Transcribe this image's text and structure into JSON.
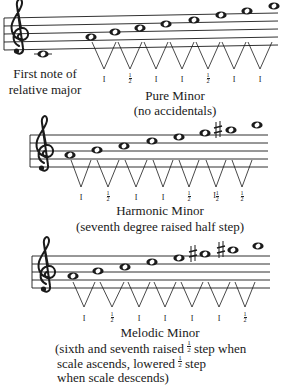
{
  "diagram": {
    "colors": {
      "ink": "#1a1a1a",
      "background": "#ffffff"
    },
    "scales": [
      {
        "id": "pure-minor",
        "name": "Pure Minor",
        "subtitle": "(no accidentals)",
        "extra_note_label_line1": "First note of",
        "extra_note_label_line2": "relative major",
        "notes": [
          "C4",
          "A4",
          "B4",
          "C5",
          "D5",
          "E5",
          "F5",
          "G5",
          "A5"
        ],
        "accidentals": [],
        "steps": [
          "1",
          "½",
          "1",
          "1",
          "½",
          "1",
          "1"
        ]
      },
      {
        "id": "harmonic-minor",
        "name": "Harmonic Minor",
        "subtitle": "(seventh degree raised half step)",
        "notes": [
          "A4",
          "B4",
          "C5",
          "D5",
          "E5",
          "F5",
          "G#5",
          "A5"
        ],
        "accidentals": [
          "sharp on G5"
        ],
        "steps": [
          "1",
          "½",
          "1",
          "1",
          "½",
          "1½",
          "½"
        ]
      },
      {
        "id": "melodic-minor",
        "name": "Melodic Minor",
        "subtitle_line1": "(sixth and seventh raised ½ step when",
        "subtitle_line2": "scale ascends, lowered ½ step",
        "subtitle_line3": "when scale descends)",
        "notes": [
          "A4",
          "B4",
          "C5",
          "D5",
          "E5",
          "F#5",
          "G#5",
          "A5"
        ],
        "accidentals": [
          "sharp on F5",
          "sharp on G5"
        ],
        "steps": [
          "1",
          "½",
          "1",
          "1",
          "1",
          "1",
          "½"
        ]
      }
    ]
  },
  "labels": {
    "one": "I",
    "half_num": "1",
    "half_den": "2",
    "pure": {
      "first_note_1": "First note of",
      "first_note_2": "relative major",
      "title": "Pure Minor",
      "sub": "(no accidentals)"
    },
    "harmonic": {
      "title": "Harmonic Minor",
      "sub": "(seventh degree raised half step)"
    },
    "melodic": {
      "title": "Melodic Minor",
      "sub1a": "(sixth and seventh raised ",
      "sub1b": " step when",
      "sub2a": "scale ascends, lowered ",
      "sub2b": " step",
      "sub3": "when scale descends)"
    }
  }
}
